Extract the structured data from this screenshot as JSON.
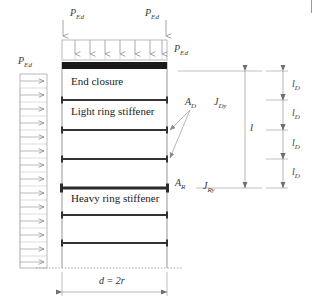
{
  "figure": {
    "type": "engineering-diagram"
  },
  "loads": {
    "axial_left": {
      "symbol": "P",
      "subscript": "Ed"
    },
    "axial_right": {
      "symbol": "P",
      "subscript": "Ed"
    },
    "distributed_top": {
      "symbol": "P",
      "subscript": "Ed"
    },
    "lateral_left": {
      "symbol": "P",
      "subscript": "Ed"
    },
    "top_arrow_count": 7,
    "side_arrow_count": 14
  },
  "components": {
    "end_closure": "End closure",
    "light_ring_stiffener": "Light ring stiffener",
    "heavy_ring_stiffener": "Heavy ring stiffener"
  },
  "annotations": {
    "light_area": {
      "symbol": "A",
      "subscript": "D"
    },
    "light_inertia": {
      "symbol": "J",
      "subscript": "Dy"
    },
    "heavy_area": {
      "symbol": "A",
      "subscript": "R"
    },
    "heavy_inertia": {
      "symbol": "J",
      "subscript": "Ry"
    }
  },
  "dimensions": {
    "overall_length": {
      "symbol": "l",
      "subscript": ""
    },
    "segment_labels": [
      {
        "symbol": "l",
        "subscript": "D"
      },
      {
        "symbol": "l",
        "subscript": "D"
      },
      {
        "symbol": "l",
        "subscript": "D"
      },
      {
        "symbol": "l",
        "subscript": "D"
      }
    ],
    "diameter": "d = 2r"
  },
  "geometry": {
    "cylinder_left_x": 62,
    "cylinder_right_x": 167,
    "cylinder_top_y": 62,
    "cylinder_bottom_y": 268,
    "stiffener_rows": [
      {
        "y": 100,
        "type": "light"
      },
      {
        "y": 130,
        "type": "light"
      },
      {
        "y": 159,
        "type": "light"
      },
      {
        "y": 188,
        "type": "heavy"
      },
      {
        "y": 215,
        "type": "light"
      },
      {
        "y": 243,
        "type": "light"
      }
    ]
  },
  "colors": {
    "line": "#4a4a4a",
    "bar": "#333333",
    "closure_fill": "#1a1a1a",
    "dimension": "#7a7a7a",
    "arrow": "#8a8a8a",
    "text": "#2a2a2a"
  }
}
